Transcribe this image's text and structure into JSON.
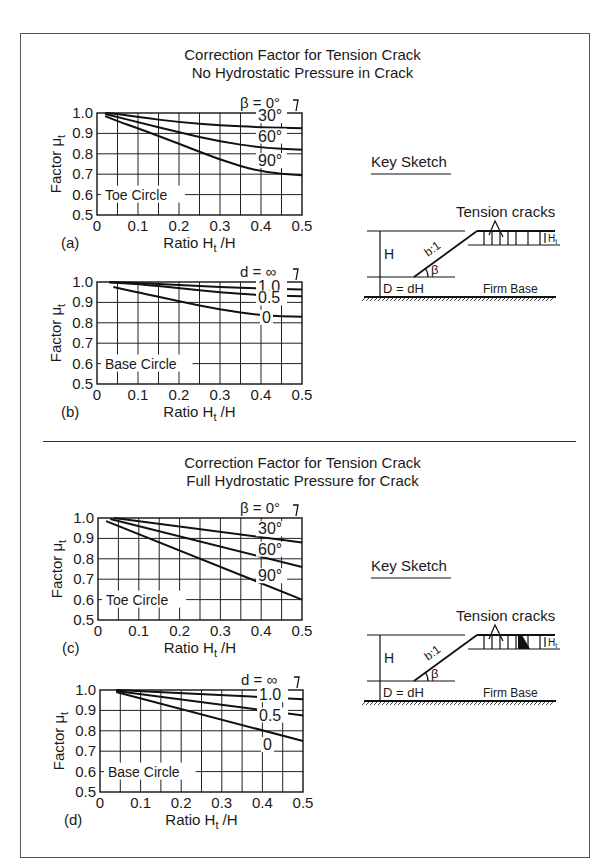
{
  "sections": [
    {
      "title_line1": "Correction Factor for Tension Crack",
      "title_line2": "No Hydrostatic Pressure in Crack",
      "key_sketch": {
        "label": "Key Sketch",
        "tension_cracks": "Tension cracks",
        "H": "H",
        "Ht": "Ht",
        "slope": "b:1",
        "beta": "β",
        "D": "D = dH",
        "firm_base": "Firm Base",
        "water_in_crack": false
      }
    },
    {
      "title_line1": "Correction Factor for Tension Crack",
      "title_line2": "Full Hydrostatic Pressure for Crack",
      "key_sketch": {
        "label": "Key Sketch",
        "tension_cracks": "Tension cracks",
        "H": "H",
        "Ht": "Ht",
        "slope": "b:1",
        "beta": "β",
        "D": "D = dH",
        "firm_base": "Firm Base",
        "water_in_crack": true
      }
    }
  ],
  "chart_data": [
    {
      "id": "a",
      "panel_label": "(a)",
      "type": "line",
      "title": "Correction Factor for Tension Crack – No Hydrostatic Pressure in Crack",
      "xlabel": "Ratio Ht /H",
      "ylabel": "Factor μt",
      "xlim": [
        0,
        0.5
      ],
      "ylim": [
        0.5,
        1.0
      ],
      "xticks": [
        "0",
        "0.1",
        "0.2",
        "0.3",
        "0.4",
        "0.5"
      ],
      "yticks": [
        "0.5",
        "0.6",
        "0.7",
        "0.8",
        "0.9",
        "1.0"
      ],
      "grid": true,
      "annotation": "Toe Circle",
      "legend_title": "β = 0°",
      "series": [
        {
          "name": "β = 0°",
          "label": "",
          "x": [
            0,
            0.5
          ],
          "y": [
            1.0,
            1.0
          ]
        },
        {
          "name": "30°",
          "label": "30°",
          "x": [
            0.02,
            0.05,
            0.1,
            0.2,
            0.3,
            0.4,
            0.5
          ],
          "y": [
            1.0,
            0.995,
            0.98,
            0.955,
            0.94,
            0.93,
            0.925
          ]
        },
        {
          "name": "60°",
          "label": "60°",
          "x": [
            0.02,
            0.05,
            0.1,
            0.2,
            0.3,
            0.4,
            0.5
          ],
          "y": [
            0.995,
            0.98,
            0.955,
            0.905,
            0.86,
            0.83,
            0.82
          ]
        },
        {
          "name": "90°",
          "label": "90°",
          "x": [
            0.02,
            0.05,
            0.1,
            0.2,
            0.3,
            0.4,
            0.5
          ],
          "y": [
            0.985,
            0.96,
            0.925,
            0.85,
            0.77,
            0.71,
            0.695
          ]
        }
      ]
    },
    {
      "id": "b",
      "panel_label": "(b)",
      "type": "line",
      "xlabel": "Ratio Ht /H",
      "ylabel": "Factor μt",
      "xlim": [
        0,
        0.5
      ],
      "ylim": [
        0.5,
        1.0
      ],
      "xticks": [
        "0",
        "0.1",
        "0.2",
        "0.3",
        "0.4",
        "0.5"
      ],
      "yticks": [
        "0.5",
        "0.6",
        "0.7",
        "0.8",
        "0.9",
        "1.0"
      ],
      "grid": true,
      "annotation": "Base Circle",
      "legend_title": "d = ∞",
      "series": [
        {
          "name": "d = ∞",
          "label": "",
          "x": [
            0,
            0.5
          ],
          "y": [
            1.0,
            1.0
          ]
        },
        {
          "name": "1.0",
          "label": "1.0",
          "x": [
            0.03,
            0.1,
            0.2,
            0.3,
            0.4,
            0.5
          ],
          "y": [
            1.0,
            0.995,
            0.985,
            0.975,
            0.968,
            0.963
          ]
        },
        {
          "name": "0.5",
          "label": "0.5",
          "x": [
            0.03,
            0.1,
            0.2,
            0.3,
            0.4,
            0.5
          ],
          "y": [
            0.998,
            0.99,
            0.97,
            0.95,
            0.935,
            0.93
          ]
        },
        {
          "name": "0",
          "label": "0",
          "x": [
            0.04,
            0.1,
            0.2,
            0.3,
            0.4,
            0.5
          ],
          "y": [
            0.975,
            0.95,
            0.905,
            0.865,
            0.835,
            0.83
          ]
        }
      ]
    },
    {
      "id": "c",
      "panel_label": "(c)",
      "type": "line",
      "title": "Correction Factor for Tension Crack – Full Hydrostatic Pressure for Crack",
      "xlabel": "Ratio Ht /H",
      "ylabel": "Factor μt",
      "xlim": [
        0,
        0.5
      ],
      "ylim": [
        0.5,
        1.0
      ],
      "xticks": [
        "0",
        "0.1",
        "0.2",
        "0.3",
        "0.4",
        "0.5"
      ],
      "yticks": [
        "0.5",
        "0.6",
        "0.7",
        "0.8",
        "0.9",
        "1.0"
      ],
      "grid": true,
      "annotation": "Toe Circle",
      "legend_title": "β = 0°",
      "series": [
        {
          "name": "β = 0°",
          "label": "",
          "x": [
            0,
            0.5
          ],
          "y": [
            1.0,
            1.0
          ]
        },
        {
          "name": "30°",
          "label": "30°",
          "x": [
            0.04,
            0.5
          ],
          "y": [
            1.0,
            0.88
          ]
        },
        {
          "name": "60°",
          "label": "60°",
          "x": [
            0.03,
            0.5
          ],
          "y": [
            0.995,
            0.76
          ]
        },
        {
          "name": "90°",
          "label": "90°",
          "x": [
            0.02,
            0.5
          ],
          "y": [
            0.985,
            0.6
          ]
        }
      ]
    },
    {
      "id": "d",
      "panel_label": "(d)",
      "type": "line",
      "xlabel": "Ratio Ht /H",
      "ylabel": "Factor μt",
      "xlim": [
        0,
        0.5
      ],
      "ylim": [
        0.5,
        1.0
      ],
      "xticks": [
        "0",
        "0.1",
        "0.2",
        "0.3",
        "0.4",
        "0.5"
      ],
      "yticks": [
        "0.5",
        "0.6",
        "0.7",
        "0.8",
        "0.9",
        "1.0"
      ],
      "grid": true,
      "annotation": "Base Circle",
      "legend_title": "d = ∞",
      "series": [
        {
          "name": "d = ∞",
          "label": "",
          "x": [
            0,
            0.5
          ],
          "y": [
            1.0,
            1.0
          ]
        },
        {
          "name": "1.0",
          "label": "1.0",
          "x": [
            0.04,
            0.5
          ],
          "y": [
            1.0,
            0.955
          ]
        },
        {
          "name": "0.5",
          "label": "0.5",
          "x": [
            0.04,
            0.5
          ],
          "y": [
            0.995,
            0.875
          ]
        },
        {
          "name": "0",
          "label": "0",
          "x": [
            0.04,
            0.5
          ],
          "y": [
            0.99,
            0.75
          ]
        }
      ]
    }
  ]
}
